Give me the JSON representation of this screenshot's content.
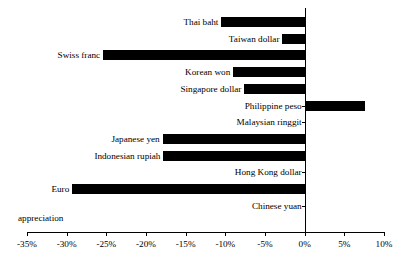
{
  "chart_data": {
    "type": "bar",
    "orientation": "horizontal",
    "title": "",
    "subtitle": "",
    "xlabel": "",
    "ylabel": "",
    "xlim": [
      -35,
      10
    ],
    "xticks": [
      -35,
      -30,
      -25,
      -20,
      -15,
      -10,
      -5,
      0,
      5,
      10
    ],
    "xtick_labels": [
      "-35%",
      "-30%",
      "-25%",
      "-20%",
      "-15%",
      "-10%",
      "-5%",
      "0%",
      "5%",
      "10%"
    ],
    "grid": false,
    "legend": null,
    "annotations": [
      {
        "name": "appreciation",
        "text": "appreciation"
      }
    ],
    "bar_color": "#000000",
    "categories": [
      "Thai baht",
      "Taiwan dollar",
      "Swiss franc",
      "Korean won",
      "Singapore dollar",
      "Philippine peso",
      "Malaysian ringgit",
      "Japanese yen",
      "Indonesian rupiah",
      "Hong Kong dollar",
      "Euro",
      "Chinese yuan"
    ],
    "values": [
      -10.5,
      -2.8,
      -25.4,
      -9.0,
      -7.6,
      7.6,
      0.0,
      -17.9,
      -17.8,
      0.0,
      -29.3,
      0.0
    ],
    "series": [
      {
        "name": "Currency change vs. US dollar",
        "values": [
          -10.5,
          -2.8,
          -25.4,
          -9.0,
          -7.6,
          7.6,
          0.0,
          -17.9,
          -17.8,
          0.0,
          -29.3,
          0.0
        ]
      }
    ]
  }
}
